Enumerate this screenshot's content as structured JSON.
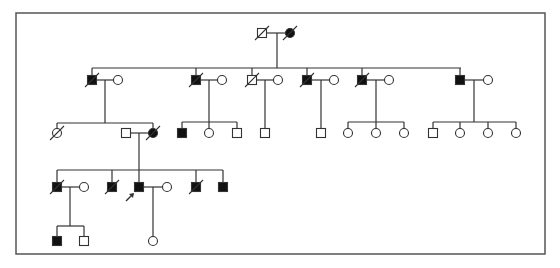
{
  "diagram": {
    "type": "pedigree",
    "frame": {
      "x": 16,
      "y": 13,
      "w": 529,
      "h": 241
    },
    "colors": {
      "line": "#333333",
      "fill_affected": "#111111",
      "background": "#ffffff",
      "frame": "#555555"
    },
    "symbol_size": 9,
    "legend": "square=male, circle=female, filled=affected, slash=deceased, arrow=proband",
    "individuals": [
      {
        "id": "I-1",
        "sex": "male",
        "affected": false,
        "deceased": true,
        "x": 262,
        "y": 33
      },
      {
        "id": "I-2",
        "sex": "female",
        "affected": true,
        "deceased": true,
        "x": 290,
        "y": 33
      },
      {
        "id": "II-1",
        "sex": "male",
        "affected": true,
        "deceased": true,
        "x": 92,
        "y": 80
      },
      {
        "id": "II-1s",
        "sex": "female",
        "affected": false,
        "deceased": false,
        "x": 118,
        "y": 80
      },
      {
        "id": "II-2",
        "sex": "male",
        "affected": true,
        "deceased": true,
        "x": 196,
        "y": 80
      },
      {
        "id": "II-2s",
        "sex": "female",
        "affected": false,
        "deceased": false,
        "x": 222,
        "y": 80
      },
      {
        "id": "II-3",
        "sex": "male",
        "affected": false,
        "deceased": true,
        "x": 252,
        "y": 80
      },
      {
        "id": "II-3s",
        "sex": "female",
        "affected": false,
        "deceased": false,
        "x": 278,
        "y": 80
      },
      {
        "id": "II-4",
        "sex": "male",
        "affected": true,
        "deceased": true,
        "x": 307,
        "y": 80
      },
      {
        "id": "II-4s",
        "sex": "female",
        "affected": false,
        "deceased": false,
        "x": 334,
        "y": 80
      },
      {
        "id": "II-5",
        "sex": "male",
        "affected": true,
        "deceased": true,
        "x": 362,
        "y": 80
      },
      {
        "id": "II-5s",
        "sex": "female",
        "affected": false,
        "deceased": false,
        "x": 389,
        "y": 80
      },
      {
        "id": "II-6",
        "sex": "male",
        "affected": true,
        "deceased": false,
        "x": 460,
        "y": 80
      },
      {
        "id": "II-6s",
        "sex": "female",
        "affected": false,
        "deceased": false,
        "x": 488,
        "y": 80
      },
      {
        "id": "III-1",
        "sex": "female",
        "affected": false,
        "deceased": true,
        "x": 57,
        "y": 133
      },
      {
        "id": "III-2s",
        "sex": "male",
        "affected": false,
        "deceased": false,
        "x": 126,
        "y": 133
      },
      {
        "id": "III-2",
        "sex": "female",
        "affected": true,
        "deceased": true,
        "x": 153,
        "y": 133
      },
      {
        "id": "III-3",
        "sex": "male",
        "affected": true,
        "deceased": false,
        "x": 182,
        "y": 133
      },
      {
        "id": "III-4",
        "sex": "female",
        "affected": false,
        "deceased": false,
        "x": 209,
        "y": 133
      },
      {
        "id": "III-5",
        "sex": "male",
        "affected": false,
        "deceased": false,
        "x": 237,
        "y": 133
      },
      {
        "id": "III-6",
        "sex": "male",
        "affected": false,
        "deceased": false,
        "x": 265,
        "y": 133
      },
      {
        "id": "III-7",
        "sex": "male",
        "affected": false,
        "deceased": false,
        "x": 321,
        "y": 133
      },
      {
        "id": "III-8",
        "sex": "female",
        "affected": false,
        "deceased": false,
        "x": 348,
        "y": 133
      },
      {
        "id": "III-9",
        "sex": "female",
        "affected": false,
        "deceased": false,
        "x": 376,
        "y": 133
      },
      {
        "id": "III-10",
        "sex": "female",
        "affected": false,
        "deceased": false,
        "x": 404,
        "y": 133
      },
      {
        "id": "III-11",
        "sex": "male",
        "affected": false,
        "deceased": false,
        "x": 433,
        "y": 133
      },
      {
        "id": "III-12",
        "sex": "female",
        "affected": false,
        "deceased": false,
        "x": 460,
        "y": 133
      },
      {
        "id": "III-13",
        "sex": "female",
        "affected": false,
        "deceased": false,
        "x": 488,
        "y": 133
      },
      {
        "id": "III-14",
        "sex": "female",
        "affected": false,
        "deceased": false,
        "x": 516,
        "y": 133
      },
      {
        "id": "IV-1",
        "sex": "male",
        "affected": true,
        "deceased": true,
        "x": 57,
        "y": 187
      },
      {
        "id": "IV-1s",
        "sex": "female",
        "affected": false,
        "deceased": false,
        "x": 84,
        "y": 187
      },
      {
        "id": "IV-2",
        "sex": "male",
        "affected": true,
        "deceased": true,
        "x": 112,
        "y": 187
      },
      {
        "id": "IV-3",
        "sex": "male",
        "affected": true,
        "deceased": false,
        "proband": true,
        "x": 139,
        "y": 187
      },
      {
        "id": "IV-3s",
        "sex": "female",
        "affected": false,
        "deceased": false,
        "x": 167,
        "y": 187
      },
      {
        "id": "IV-4",
        "sex": "male",
        "affected": true,
        "deceased": true,
        "x": 196,
        "y": 187
      },
      {
        "id": "IV-5",
        "sex": "male",
        "affected": true,
        "deceased": false,
        "x": 223,
        "y": 187
      },
      {
        "id": "V-1",
        "sex": "male",
        "affected": true,
        "deceased": false,
        "x": 57,
        "y": 241
      },
      {
        "id": "V-2",
        "sex": "male",
        "affected": false,
        "deceased": false,
        "x": 84,
        "y": 241
      },
      {
        "id": "V-3",
        "sex": "female",
        "affected": false,
        "deceased": false,
        "x": 153,
        "y": 241
      }
    ],
    "lines": [
      [
        266,
        33,
        286,
        33
      ],
      [
        277,
        33,
        277,
        68
      ],
      [
        92,
        68,
        461,
        68
      ],
      [
        92,
        68,
        92,
        76
      ],
      [
        196,
        68,
        196,
        76
      ],
      [
        252,
        68,
        252,
        76
      ],
      [
        307,
        68,
        307,
        76
      ],
      [
        362,
        68,
        362,
        76
      ],
      [
        460,
        68,
        460,
        76
      ],
      [
        96,
        80,
        114,
        80
      ],
      [
        105,
        80,
        105,
        123
      ],
      [
        200,
        80,
        218,
        80
      ],
      [
        209,
        80,
        209,
        122
      ],
      [
        256,
        80,
        274,
        80
      ],
      [
        265,
        80,
        265,
        129
      ],
      [
        311,
        80,
        330,
        80
      ],
      [
        321,
        80,
        321,
        129
      ],
      [
        366,
        80,
        385,
        80
      ],
      [
        376,
        80,
        376,
        122
      ],
      [
        464,
        80,
        484,
        80
      ],
      [
        474,
        80,
        474,
        122
      ],
      [
        57,
        123,
        153,
        123
      ],
      [
        57,
        123,
        57,
        129
      ],
      [
        153,
        123,
        153,
        129
      ],
      [
        182,
        122,
        237,
        122
      ],
      [
        182,
        122,
        182,
        129
      ],
      [
        209,
        122,
        209,
        129
      ],
      [
        237,
        122,
        237,
        129
      ],
      [
        348,
        122,
        404,
        122
      ],
      [
        348,
        122,
        348,
        129
      ],
      [
        376,
        122,
        376,
        129
      ],
      [
        404,
        122,
        404,
        129
      ],
      [
        433,
        122,
        516,
        122
      ],
      [
        433,
        122,
        433,
        129
      ],
      [
        460,
        122,
        460,
        129
      ],
      [
        488,
        122,
        488,
        129
      ],
      [
        516,
        122,
        516,
        129
      ],
      [
        130,
        133,
        149,
        133
      ],
      [
        139,
        133,
        139,
        170
      ],
      [
        57,
        170,
        223,
        170
      ],
      [
        57,
        170,
        57,
        183
      ],
      [
        112,
        170,
        112,
        183
      ],
      [
        139,
        170,
        139,
        183
      ],
      [
        196,
        170,
        196,
        183
      ],
      [
        223,
        170,
        223,
        183
      ],
      [
        61,
        187,
        80,
        187
      ],
      [
        70,
        187,
        70,
        226
      ],
      [
        143,
        187,
        163,
        187
      ],
      [
        153,
        187,
        153,
        237
      ],
      [
        57,
        226,
        84,
        226
      ],
      [
        57,
        226,
        57,
        237
      ],
      [
        84,
        226,
        84,
        237
      ]
    ],
    "proband_arrow": {
      "from": [
        126,
        201
      ],
      "to": [
        134,
        193
      ]
    }
  }
}
